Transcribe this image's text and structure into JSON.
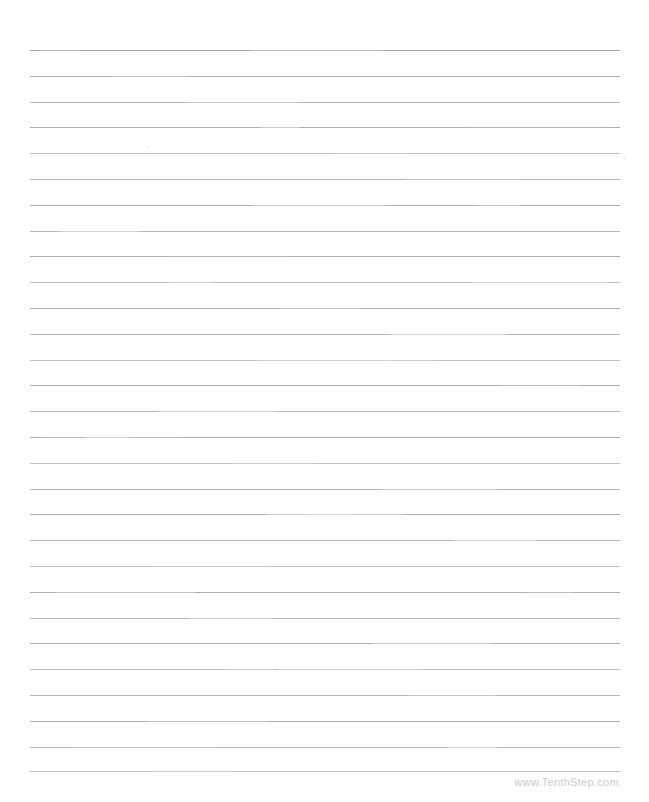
{
  "document": {
    "type": "lined-writing-paper",
    "title": "Printable Lined Paper",
    "background_color": "#ffffff",
    "page_width": 649,
    "page_height": 802
  },
  "rules": {
    "line_color": "#a9acb0",
    "line_count": 29,
    "line_left": 30,
    "line_right": 620,
    "line_width": 590,
    "first_line_y": 50,
    "line_spacing": 25.8,
    "line_thickness": 1,
    "positions": [
      50,
      75.8,
      101.6,
      127.4,
      153.2,
      179,
      204.8,
      230.6,
      256.4,
      282.2,
      308,
      333.8,
      359.6,
      385.4,
      411.2,
      437,
      462.8,
      488.6,
      514.4,
      540.2,
      566,
      591.8,
      617.6,
      643.4,
      669.2,
      695,
      720.8,
      746.6,
      771
    ],
    "fade_classes": [
      "fade-c",
      "",
      "fade-a",
      "",
      "fade-b",
      "fade-a",
      "",
      "fade-a",
      "",
      "fade-b",
      "",
      "fade-a",
      "fade-b",
      "",
      "fade-a",
      "",
      "fade-b",
      "fade-a",
      "",
      "fade-a",
      "fade-b",
      "",
      "fade-a",
      "",
      "fade-b",
      "fade-a",
      "",
      "fade-a",
      "fade-b"
    ]
  },
  "footer": {
    "website_label": "www.TenthStep.com",
    "color": "#c9cbcd"
  },
  "artifacts": {
    "specks": [
      {
        "x": 624,
        "y": 157,
        "size": 2
      },
      {
        "x": 147,
        "y": 146,
        "size": 2
      }
    ]
  }
}
